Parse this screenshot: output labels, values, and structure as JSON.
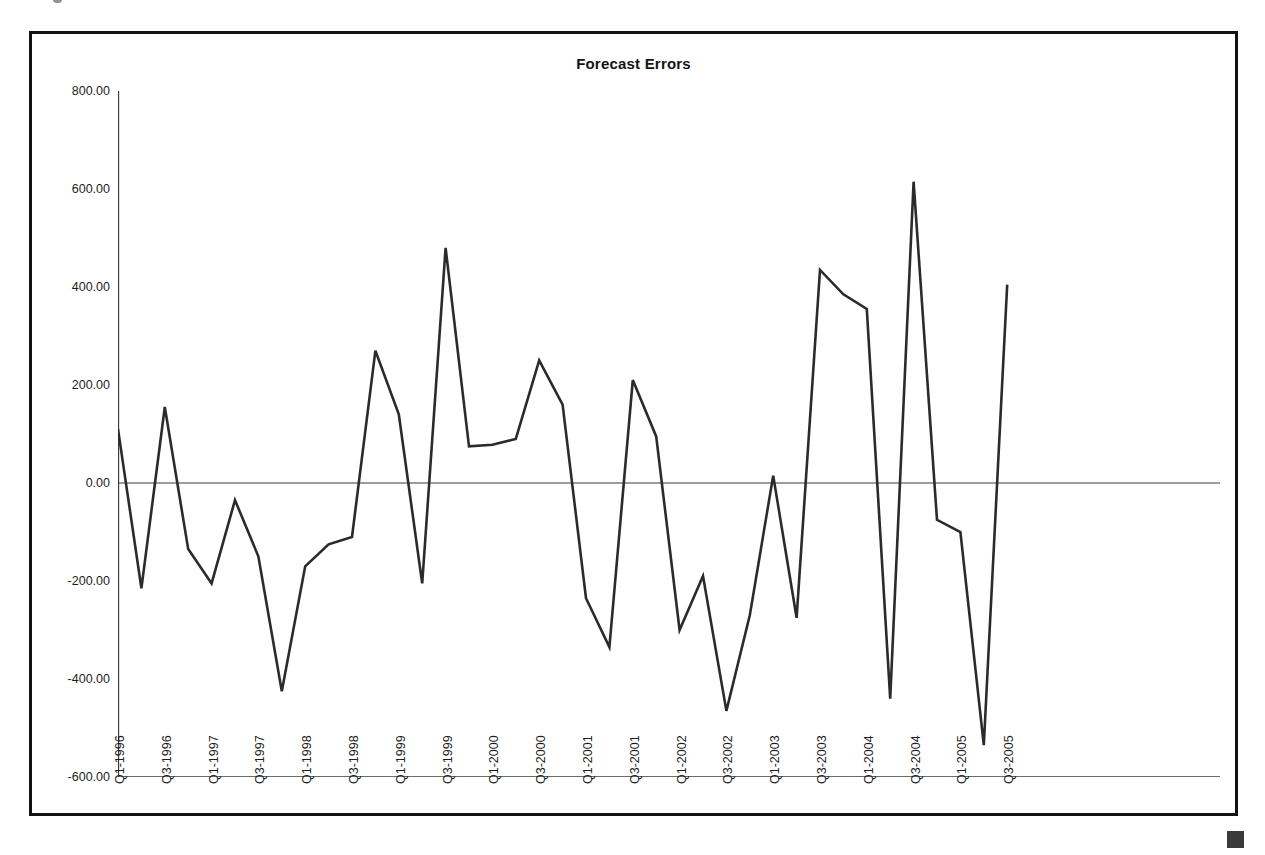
{
  "figure": {
    "title": "Forecast Errors",
    "background_color": "#ffffff",
    "frame_color": "#121212",
    "line_color": "#2b2b2b",
    "axis_color": "#3a3a3a",
    "corner_mark_color": "#3a3a3a"
  },
  "chart_data": {
    "type": "line",
    "title": "Forecast Errors",
    "xlabel": "",
    "ylabel": "",
    "ylim": [
      -600,
      800
    ],
    "yticks": [
      800,
      600,
      400,
      200,
      0,
      -200,
      -400,
      -600
    ],
    "ytick_labels": [
      "800.00",
      "600.00",
      "400.00",
      "200.00",
      "0.00",
      "-200.00",
      "-400.00",
      "-600.00"
    ],
    "grid": false,
    "legend": null,
    "zero_line": true,
    "x_tick_labels": [
      "Q1-1996",
      "Q3-1996",
      "Q1-1997",
      "Q3-1997",
      "Q1-1998",
      "Q3-1998",
      "Q1-1999",
      "Q3-1999",
      "Q1-2000",
      "Q3-2000",
      "Q1-2001",
      "Q3-2001",
      "Q1-2002",
      "Q3-2002",
      "Q1-2003",
      "Q3-2003",
      "Q1-2004",
      "Q3-2004",
      "Q1-2005",
      "Q3-2005"
    ],
    "x": [
      "Q1-1996",
      "Q2-1996",
      "Q3-1996",
      "Q4-1996",
      "Q1-1997",
      "Q2-1997",
      "Q3-1997",
      "Q4-1997",
      "Q1-1998",
      "Q2-1998",
      "Q3-1998",
      "Q4-1998",
      "Q1-1999",
      "Q2-1999",
      "Q3-1999",
      "Q4-1999",
      "Q1-2000",
      "Q2-2000",
      "Q3-2000",
      "Q4-2000",
      "Q1-2001",
      "Q2-2001",
      "Q3-2001",
      "Q4-2001",
      "Q1-2002",
      "Q2-2002",
      "Q3-2002",
      "Q4-2002",
      "Q1-2003",
      "Q2-2003",
      "Q3-2003",
      "Q4-2003",
      "Q1-2004",
      "Q2-2004",
      "Q3-2004",
      "Q4-2004",
      "Q1-2005",
      "Q2-2005",
      "Q3-2005",
      "Q4-2005"
    ],
    "values": [
      110,
      -215,
      155,
      -135,
      -205,
      -35,
      -150,
      -425,
      -170,
      -125,
      -110,
      270,
      140,
      -205,
      480,
      75,
      78,
      90,
      250,
      160,
      -235,
      -335,
      210,
      95,
      -300,
      -190,
      -465,
      -270,
      15,
      -275,
      435,
      385,
      355,
      -440,
      615,
      -75,
      -100,
      -535,
      405,
      null
    ],
    "series_name": "Forecast Errors",
    "units": ""
  },
  "axes": {
    "y_labels": [
      {
        "text": "800.00",
        "value": 800
      },
      {
        "text": "600.00",
        "value": 600
      },
      {
        "text": "400.00",
        "value": 400
      },
      {
        "text": "200.00",
        "value": 200
      },
      {
        "text": "0.00",
        "value": 0
      },
      {
        "text": "-200.00",
        "value": -200
      },
      {
        "text": "-400.00",
        "value": -400
      },
      {
        "text": "-600.00",
        "value": -600
      }
    ],
    "x_labels": [
      "Q1-1996",
      "Q3-1996",
      "Q1-1997",
      "Q3-1997",
      "Q1-1998",
      "Q3-1998",
      "Q1-1999",
      "Q3-1999",
      "Q1-2000",
      "Q3-2000",
      "Q1-2001",
      "Q3-2001",
      "Q1-2002",
      "Q3-2002",
      "Q1-2003",
      "Q3-2003",
      "Q1-2004",
      "Q3-2004",
      "Q1-2005",
      "Q3-2005"
    ]
  }
}
